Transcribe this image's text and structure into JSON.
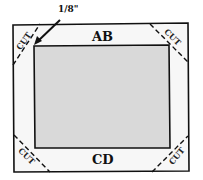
{
  "diagram": {
    "type": "mat-cutting-guide",
    "labels": {
      "top_edge": "AB",
      "bottom_edge": "CD",
      "measurement": "1/8\"",
      "corner_cut": "CUT"
    },
    "corners": [
      {
        "position": "top-left",
        "label": "CUT"
      },
      {
        "position": "top-right",
        "label": "CUT"
      },
      {
        "position": "bottom-left",
        "label": "CUT"
      },
      {
        "position": "bottom-right",
        "label": "CUT"
      }
    ],
    "colors": {
      "outline": "#111111",
      "inner_fill": "#d9d9d9",
      "border_fill": "#f7f7f7",
      "background": "#ffffff"
    }
  }
}
